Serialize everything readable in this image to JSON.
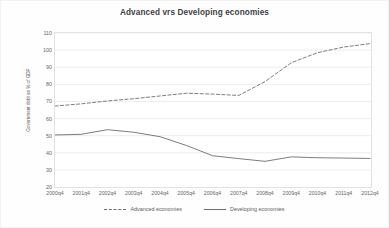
{
  "chart_data": {
    "type": "line",
    "title": "Advanced vrs Developing economies",
    "xlabel": "",
    "ylabel": "Government debt as % of GDP",
    "categories": [
      "2000q4",
      "2001q4",
      "2002q4",
      "2003q4",
      "2004q4",
      "2005q4",
      "2006q4",
      "2007q4",
      "2008q4",
      "2009q4",
      "2010q4",
      "2011q4",
      "2012q4"
    ],
    "ylim": [
      20,
      110
    ],
    "yticks": [
      20,
      30,
      40,
      50,
      60,
      70,
      80,
      90,
      100,
      110
    ],
    "grid": true,
    "legend_position": "bottom",
    "series": [
      {
        "name": "Advanced economies",
        "style": "dashed",
        "color": "#6e6e6e",
        "values": [
          67.3,
          68.6,
          70.3,
          71.6,
          73.2,
          74.8,
          74.3,
          73.5,
          81.6,
          92.6,
          98.5,
          101.8,
          103.8
        ]
      },
      {
        "name": "Developing economies",
        "style": "solid",
        "color": "#6e6e6e",
        "values": [
          50.4,
          50.8,
          53.5,
          52.0,
          49.4,
          44.3,
          38.3,
          36.6,
          35.0,
          37.6,
          37.1,
          36.9,
          36.7
        ]
      }
    ]
  },
  "legend": {
    "items": [
      {
        "label": "Advanced economies"
      },
      {
        "label": "Developing economies"
      }
    ]
  }
}
